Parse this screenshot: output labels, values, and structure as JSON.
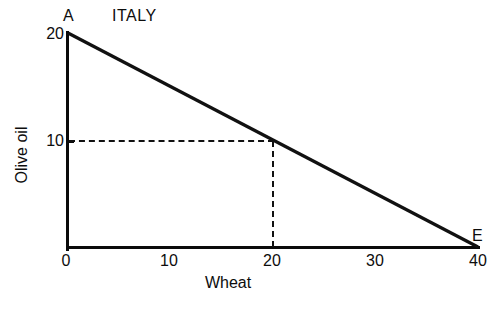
{
  "chart_data": {
    "type": "line",
    "title": "ITALY",
    "xlabel": "Wheat",
    "ylabel": "Olive oil",
    "xlim": [
      0,
      40
    ],
    "ylim": [
      0,
      20
    ],
    "grid": false,
    "legend": null,
    "x_ticks": [
      "0",
      "10",
      "20",
      "30",
      "40"
    ],
    "x_tick_values": [
      0,
      10,
      20,
      30,
      40
    ],
    "y_ticks": [
      "20",
      "10"
    ],
    "y_tick_values": [
      20,
      10
    ],
    "series": [
      {
        "name": "Production possibility frontier",
        "x": [
          0,
          40
        ],
        "values": [
          20,
          0
        ],
        "style": "solid",
        "color": "#111111"
      }
    ],
    "annotations": [
      {
        "label": "A",
        "x": 0,
        "y": 20,
        "note": "olive-oil intercept endpoint"
      },
      {
        "label": "E",
        "x": 40,
        "y": 0,
        "note": "wheat intercept endpoint"
      }
    ],
    "guide_lines": [
      {
        "orientation": "horizontal",
        "value": 10,
        "from": 0,
        "to": 20,
        "style": "dashed"
      },
      {
        "orientation": "vertical",
        "value": 20,
        "from": 0,
        "to": 10,
        "style": "dashed"
      }
    ]
  },
  "labels": {
    "title": "ITALY",
    "x_axis_title": "Wheat",
    "y_axis_title": "Olive oil",
    "point_a": "A",
    "point_e": "E",
    "x_tick_0": "0",
    "x_tick_10": "10",
    "x_tick_20": "20",
    "x_tick_30": "30",
    "x_tick_40": "40",
    "y_tick_20": "20",
    "y_tick_10": "10"
  },
  "colors": {
    "background": "#ffffff",
    "axis": "#0a0a0a",
    "line": "#111111",
    "text": "#0d0d0d",
    "guide": "#111111"
  }
}
